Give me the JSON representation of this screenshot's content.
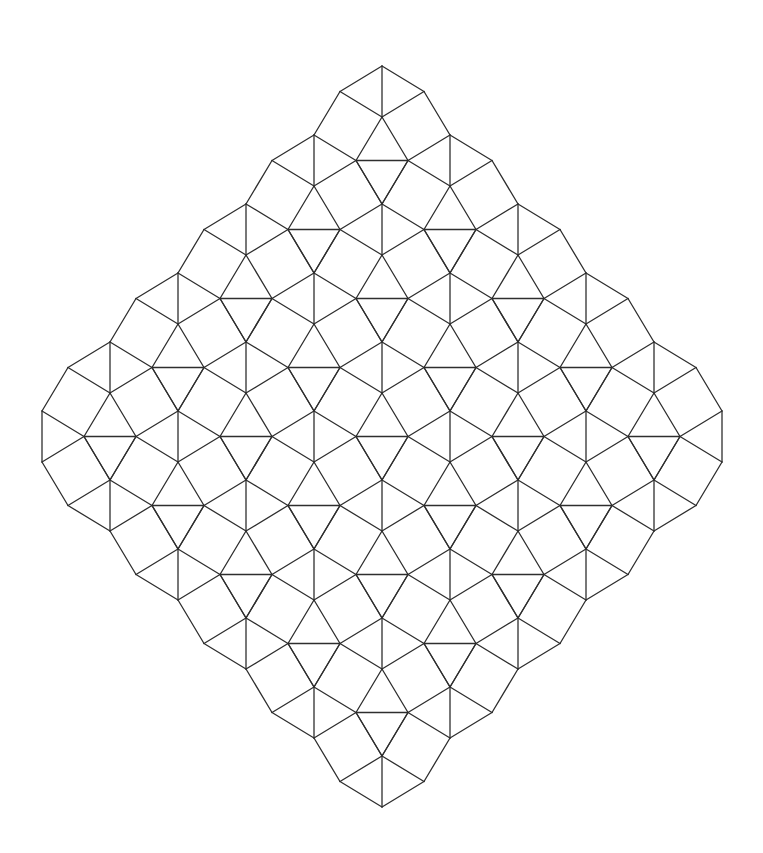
{
  "figure": {
    "background": "#ffffff",
    "stroke_color": "#2e2e2e",
    "stroke_width": 1.3
  },
  "tiling": {
    "type": "snub-square",
    "origin": [
      382,
      66
    ],
    "lattice_u": [
      -68,
      69
    ],
    "lattice_w": [
      68,
      69
    ],
    "i_range": [
      0,
      5
    ],
    "j_range": [
      0,
      5
    ],
    "cell_vertices": {
      "P0": [
        0,
        0
      ],
      "P1": [
        0,
        51
      ],
      "P2": [
        -42,
        25.5
      ],
      "P3": [
        42,
        25.5
      ]
    },
    "missing_vertices": [
      {
        "vertex": "P2",
        "i": 5,
        "j": 0
      },
      {
        "vertex": "P3",
        "i": 0,
        "j": 5
      }
    ],
    "extremes": {
      "top": [
        382,
        66
      ],
      "bottom": [
        382,
        807
      ],
      "left": [
        42,
        436
      ],
      "right": [
        724,
        436
      ]
    }
  }
}
